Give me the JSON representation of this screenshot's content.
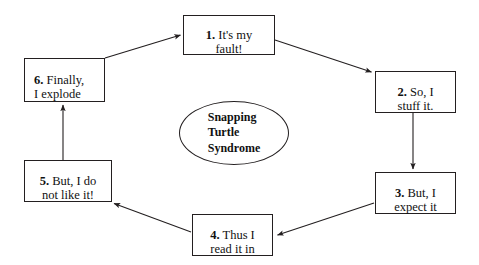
{
  "diagram": {
    "title": "Snapping Turtle Syndrome",
    "center_label": "Snapping\nTurtle\nSyndrome",
    "line_color": "#231f20",
    "text_color": "#111111",
    "background_color": "#ffffff",
    "nodes": [
      {
        "id": "step-1",
        "number": "1.",
        "text": " It's my\nfault!",
        "align": "center"
      },
      {
        "id": "step-2",
        "number": "2.",
        "text": " So, I\nstuff it.",
        "align": "center"
      },
      {
        "id": "step-3",
        "number": "3.",
        "text": " But, I\nexpect it",
        "align": "center"
      },
      {
        "id": "step-4",
        "number": "4.",
        "text": " Thus I\nread it in",
        "align": "center"
      },
      {
        "id": "step-5",
        "number": "5.",
        "text": " But, I do\nnot like it!",
        "align": "center"
      },
      {
        "id": "step-6",
        "number": "6.",
        "text": " Finally,\nI explode",
        "align": "left"
      }
    ],
    "connections": [
      {
        "from": "step-1",
        "to": "step-2",
        "kind": "diagonal-down-right"
      },
      {
        "from": "step-2",
        "to": "step-3",
        "kind": "vertical-down"
      },
      {
        "from": "step-3",
        "to": "step-4",
        "kind": "diagonal-down-left"
      },
      {
        "from": "step-4",
        "to": "step-5",
        "kind": "diagonal-up-left"
      },
      {
        "from": "step-5",
        "to": "step-6",
        "kind": "vertical-up"
      },
      {
        "from": "step-6",
        "to": "step-1",
        "kind": "diagonal-up-right"
      }
    ]
  }
}
